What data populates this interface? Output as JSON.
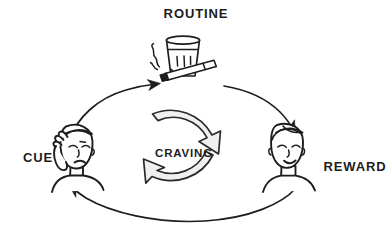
{
  "diagram": {
    "background_color": "#ffffff",
    "ink_color": "#1d1d1d",
    "arc_fill_color": "#f0f0f0",
    "style": "hand-drawn line illustration",
    "nodes": [
      {
        "id": "cue",
        "label": "CUE",
        "icon": "stressed-face-icon",
        "description": "person holding hand to forehead, frowning",
        "position": "left"
      },
      {
        "id": "routine",
        "label": "ROUTINE",
        "icon": "glass-and-cigarette-icon",
        "description": "drinking glass with lit cigarette and smoke",
        "position": "top"
      },
      {
        "id": "reward",
        "label": "REWARD",
        "icon": "content-face-icon",
        "description": "relaxed person with closed eyes and slight smile",
        "position": "right"
      },
      {
        "id": "craving",
        "label": "CRAVING",
        "icon": "circular-loop-arrows-icon",
        "description": "two thick curved arrows forming a clockwise circle",
        "position": "center"
      }
    ],
    "connections": [
      {
        "id": "cue-to-routine",
        "from": "CUE",
        "to": "ROUTINE",
        "direction": "clockwise-up-right"
      },
      {
        "id": "routine-to-reward",
        "from": "ROUTINE",
        "to": "REWARD",
        "direction": "clockwise-down-right"
      },
      {
        "id": "reward-to-cue",
        "from": "REWARD",
        "to": "CUE",
        "direction": "clockwise-bottom-left"
      }
    ]
  }
}
